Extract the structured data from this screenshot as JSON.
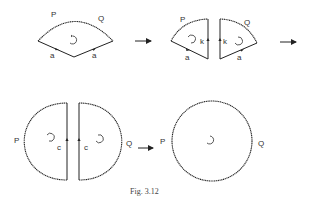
{
  "figure": {
    "caption": "Fig. 3.12",
    "colors": {
      "line": "#222222",
      "text": "#333333",
      "background": "#ffffff"
    }
  },
  "panels": [
    {
      "id": "sector",
      "labels": {
        "arc_left": "P",
        "arc_right": "Q",
        "edge_left": "a",
        "edge_right": "a"
      }
    },
    {
      "id": "split-sectors",
      "labels": {
        "arc_left": "P",
        "arc_right": "Q",
        "cut_left": "k",
        "cut_right": "k",
        "edge_left": "a",
        "edge_right": "a"
      }
    },
    {
      "id": "half-discs",
      "labels": {
        "left": "P",
        "right": "Q",
        "cut_left": "c",
        "cut_right": "c"
      }
    },
    {
      "id": "disc",
      "labels": {
        "left": "P",
        "right": "Q"
      }
    }
  ],
  "arrows": [
    "→",
    "→",
    "→"
  ]
}
